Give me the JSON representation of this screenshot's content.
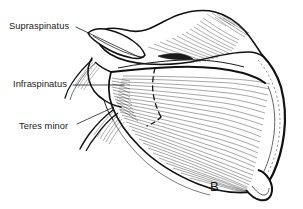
{
  "figure": {
    "panel_label": "B",
    "view": "posterior-scapula-rotator-cuff",
    "background_color": "#ffffff",
    "ink_color": "#111111",
    "fiber_color": "#2b2b2b"
  },
  "labels": [
    {
      "id": "supraspinatus",
      "text": "Supraspinatus",
      "leader_from": [
        76,
        27
      ],
      "leader_to": [
        140,
        57
      ]
    },
    {
      "id": "infraspinatus",
      "text": "Infraspinatus",
      "leader_from": [
        71,
        85
      ],
      "leader_to": [
        122,
        85
      ]
    },
    {
      "id": "teres_minor",
      "text": "Teres minor",
      "leader_from": [
        76,
        124
      ],
      "leader_to": [
        113,
        108
      ]
    }
  ],
  "structures": [
    {
      "name": "acromion",
      "region": "superior-lateral"
    },
    {
      "name": "spine-of-scapula",
      "region": "transverse-midline"
    },
    {
      "name": "supraspinous-fossa",
      "region": "superior"
    },
    {
      "name": "infraspinous-fossa",
      "region": "inferior"
    },
    {
      "name": "medial-border",
      "region": "right-edge"
    },
    {
      "name": "lateral-border",
      "region": "lower-left-to-inferior-angle"
    },
    {
      "name": "inferior-angle",
      "region": "bottom-right"
    },
    {
      "name": "glenoid-neck",
      "region": "left"
    },
    {
      "name": "teres-minor-infraspinatus-boundary",
      "region": "dashed-curve-center"
    }
  ]
}
